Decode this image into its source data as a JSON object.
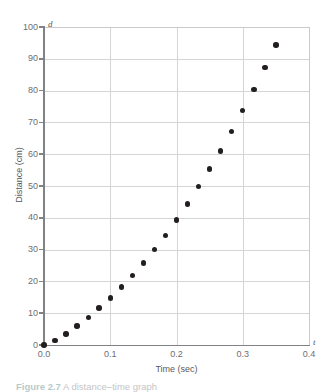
{
  "figure": {
    "caption_prefix": "Figure",
    "caption_number": "2.7",
    "caption_text": "A distance–time graph"
  },
  "axes": {
    "x_title": "Time (sec)",
    "y_title": "Distance (cm)",
    "x_variable_symbol": "t",
    "y_variable_symbol": "d",
    "x_tick_labels": [
      "0.0",
      "0.1",
      "0.2",
      "0.3",
      "0.4"
    ],
    "y_tick_labels": [
      "0",
      "10",
      "20",
      "30",
      "40",
      "50",
      "60",
      "70",
      "80",
      "90",
      "100"
    ]
  },
  "colors": {
    "point": "#231f20",
    "axis": "#808285",
    "gridline": "#d4d5d7",
    "text": "#58595b",
    "background": "#ffffff"
  },
  "chart_data": {
    "type": "scatter",
    "title": "",
    "xlabel": "Time (sec)",
    "ylabel": "Distance (cm)",
    "xlim": [
      0.0,
      0.4
    ],
    "ylim": [
      0,
      100
    ],
    "xticks": [
      0.0,
      0.1,
      0.2,
      0.3,
      0.4
    ],
    "yticks": [
      0,
      10,
      20,
      30,
      40,
      50,
      60,
      70,
      80,
      90,
      100
    ],
    "grid": true,
    "legend": false,
    "series": [
      {
        "name": "Distance vs time",
        "marker": "filled-circle",
        "color": "#231f20",
        "x": [
          0.0,
          0.0167,
          0.0333,
          0.05,
          0.0667,
          0.0833,
          0.1,
          0.1167,
          0.1333,
          0.15,
          0.1667,
          0.1833,
          0.2,
          0.2167,
          0.2333,
          0.25,
          0.2667,
          0.2833,
          0.3,
          0.3167,
          0.3333,
          0.35
        ],
        "y": [
          0.0,
          1.5,
          3.5,
          6.0,
          8.7,
          11.6,
          14.8,
          18.2,
          21.9,
          25.8,
          30.0,
          34.5,
          39.3,
          44.4,
          49.8,
          55.3,
          61.0,
          67.2,
          73.7,
          80.4,
          87.3,
          94.4
        ]
      }
    ]
  }
}
